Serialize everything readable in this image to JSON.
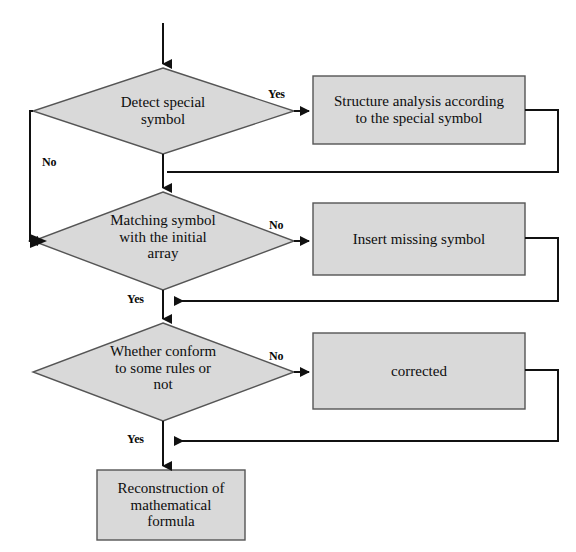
{
  "diagram": {
    "orientation": "top-to-bottom",
    "colors": {
      "node_fill": "#d9d9d9",
      "node_stroke": "#555555",
      "edge_stroke": "#111111",
      "text": "#0d0d0d",
      "background": "#ffffff"
    }
  },
  "nodes": {
    "entry": {
      "type": "arrow",
      "name": "entry-arrow"
    },
    "decision1": {
      "type": "decision",
      "label": "Detect special\nsymbol"
    },
    "process1": {
      "type": "process",
      "label": "Structure analysis according\nto the special symbol"
    },
    "decision2": {
      "type": "decision",
      "label": "Matching  symbol\nwith the initial\narray"
    },
    "process2": {
      "type": "process",
      "label": "Insert missing symbol"
    },
    "decision3": {
      "type": "decision",
      "label": "Whether conform\nto  some rules or\nnot"
    },
    "process3": {
      "type": "process",
      "label": "corrected"
    },
    "terminal": {
      "type": "process",
      "label": "Reconstruction of\nmathematical\nformula"
    }
  },
  "edges": {
    "d1_yes": "Yes",
    "d1_no": "No",
    "d2_no": "No",
    "d2_yes": "Yes",
    "d3_no": "No",
    "d3_yes": "Yes"
  }
}
